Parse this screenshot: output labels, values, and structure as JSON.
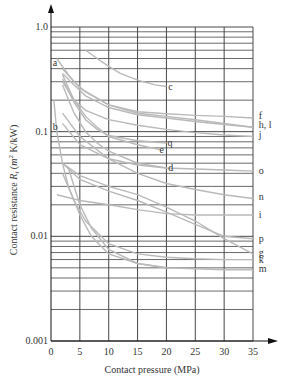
{
  "chart_data": {
    "type": "line",
    "title": "",
    "xlabel": "Contact pressure (MPa)",
    "ylabel": "Contact resistance R_t (m² K/kW)",
    "ylabel_parts": {
      "prefix": "Contact resistance ",
      "symbol": "R",
      "sub": "t",
      "units_open": " (",
      "unit_m": "m",
      "sup": "2",
      "units_rest": " K/kW)"
    },
    "xlim": [
      0,
      35
    ],
    "ylim": [
      0.001,
      1.0
    ],
    "yscale": "log",
    "grid": true,
    "x_ticks": [
      "0",
      "5",
      "10",
      "15",
      "20",
      "25",
      "30",
      "35"
    ],
    "y_ticks": [
      "0.001",
      "0.01",
      "0.1",
      "1.0"
    ],
    "curve_color": "#b9b9b9",
    "series": [
      {
        "name": "a",
        "x": [
          1,
          3,
          5,
          10,
          15,
          20,
          25,
          30,
          35
        ],
        "values": [
          0.5,
          0.35,
          0.26,
          0.18,
          0.15,
          0.14,
          0.13,
          0.12,
          0.11
        ]
      },
      {
        "name": "b",
        "x": [
          0.5,
          1,
          2,
          3,
          5,
          7,
          10,
          15,
          20
        ],
        "values": [
          0.2,
          0.1,
          0.05,
          0.03,
          0.016,
          0.01,
          0.0068,
          0.0055,
          0.005
        ]
      },
      {
        "name": "c",
        "x": [
          6,
          8,
          10,
          12,
          15,
          18,
          20
        ],
        "values": [
          0.6,
          0.5,
          0.42,
          0.36,
          0.31,
          0.28,
          0.27
        ]
      },
      {
        "name": "d",
        "x": [
          2,
          4,
          6,
          8,
          10,
          15,
          20
        ],
        "values": [
          0.28,
          0.15,
          0.1,
          0.078,
          0.065,
          0.05,
          0.045
        ]
      },
      {
        "name": "e",
        "x": [
          2,
          4,
          6,
          8,
          10,
          15,
          19
        ],
        "values": [
          0.35,
          0.2,
          0.14,
          0.11,
          0.09,
          0.075,
          0.067
        ]
      },
      {
        "name": "f",
        "x": [
          2,
          4,
          6,
          10,
          15,
          20,
          25,
          30,
          35
        ],
        "values": [
          0.4,
          0.3,
          0.24,
          0.18,
          0.155,
          0.148,
          0.143,
          0.14,
          0.135
        ]
      },
      {
        "name": "g",
        "x": [
          2,
          5,
          10,
          15,
          20,
          25,
          30,
          35
        ],
        "values": [
          0.05,
          0.038,
          0.03,
          0.025,
          0.019,
          0.014,
          0.0095,
          0.0068
        ]
      },
      {
        "name": "h, l",
        "x": [
          2,
          4,
          6,
          10,
          15,
          20,
          25,
          30,
          35
        ],
        "values": [
          0.36,
          0.28,
          0.22,
          0.17,
          0.145,
          0.135,
          0.125,
          0.117,
          0.11
        ]
      },
      {
        "name": "i",
        "x": [
          1,
          5,
          10,
          15,
          20,
          25,
          30,
          35
        ],
        "values": [
          0.025,
          0.022,
          0.02,
          0.018,
          0.0165,
          0.016,
          0.016,
          0.016
        ]
      },
      {
        "name": "j",
        "x": [
          2,
          4,
          6,
          10,
          15,
          20,
          25,
          30,
          35
        ],
        "values": [
          0.3,
          0.2,
          0.16,
          0.13,
          0.115,
          0.105,
          0.098,
          0.093,
          0.09
        ]
      },
      {
        "name": "k",
        "x": [
          2,
          4,
          6,
          10,
          15,
          20,
          25,
          30,
          35
        ],
        "values": [
          0.04,
          0.022,
          0.014,
          0.0085,
          0.0068,
          0.0063,
          0.0061,
          0.006,
          0.006
        ]
      },
      {
        "name": "m",
        "x": [
          3,
          5,
          7,
          10,
          15,
          20,
          25,
          30,
          35
        ],
        "values": [
          0.045,
          0.02,
          0.012,
          0.0075,
          0.0055,
          0.005,
          0.0049,
          0.0048,
          0.0048
        ]
      },
      {
        "name": "n",
        "x": [
          2,
          5,
          10,
          15,
          20,
          25,
          30,
          35
        ],
        "values": [
          0.15,
          0.09,
          0.055,
          0.04,
          0.032,
          0.028,
          0.025,
          0.023
        ]
      },
      {
        "name": "o",
        "x": [
          2,
          5,
          10,
          15,
          20,
          25,
          30,
          35
        ],
        "values": [
          0.12,
          0.075,
          0.055,
          0.048,
          0.045,
          0.044,
          0.043,
          0.042
        ]
      },
      {
        "name": "p",
        "x": [
          2,
          5,
          10,
          15,
          20,
          25,
          30,
          35
        ],
        "values": [
          0.05,
          0.035,
          0.027,
          0.022,
          0.017,
          0.013,
          0.01,
          0.0095
        ]
      },
      {
        "name": "q",
        "x": [
          2,
          4,
          6,
          8,
          10,
          15,
          20
        ],
        "values": [
          0.32,
          0.19,
          0.13,
          0.105,
          0.092,
          0.082,
          0.078
        ]
      }
    ],
    "annotations": [
      {
        "text": "a",
        "x": 0.3,
        "y": 0.45
      },
      {
        "text": "b",
        "x": 0.3,
        "y": 0.11
      },
      {
        "text": "c",
        "x": 20.3,
        "y": 0.27
      },
      {
        "text": "q",
        "x": 20.2,
        "y": 0.078
      },
      {
        "text": "e",
        "x": 18.8,
        "y": 0.067
      },
      {
        "text": "d",
        "x": 20.3,
        "y": 0.045
      },
      {
        "text": "f",
        "x": 36,
        "y": 0.14
      },
      {
        "text": "h, l",
        "x": 36,
        "y": 0.115
      },
      {
        "text": "j",
        "x": 36,
        "y": 0.093
      },
      {
        "text": "o",
        "x": 36,
        "y": 0.042
      },
      {
        "text": "n",
        "x": 36,
        "y": 0.024
      },
      {
        "text": "i",
        "x": 36,
        "y": 0.016
      },
      {
        "text": "p",
        "x": 36,
        "y": 0.0095
      },
      {
        "text": "g",
        "x": 36,
        "y": 0.0069
      },
      {
        "text": "k",
        "x": 36,
        "y": 0.006
      },
      {
        "text": "m",
        "x": 36,
        "y": 0.0049
      }
    ],
    "legend": "none (curves labeled inline)"
  }
}
